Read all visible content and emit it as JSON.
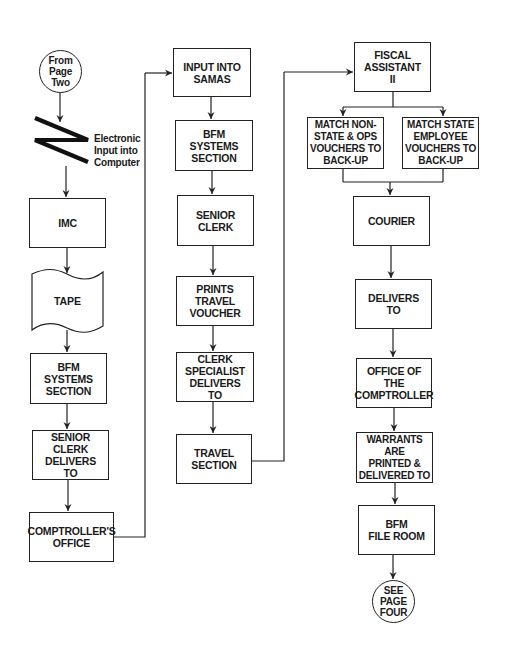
{
  "diagram": {
    "type": "flowchart",
    "colors": {
      "stroke": "#222222",
      "text": "#1a1a1a",
      "background": "#ffffff"
    },
    "columns": [
      {
        "id": "left",
        "nodes": [
          {
            "id": "from-page-two",
            "shape": "circle-connector",
            "label": "From\nPage Two"
          },
          {
            "id": "electronic-input",
            "shape": "lightning-communication-link",
            "label": "Electronic\nInput into\nComputer"
          },
          {
            "id": "imc",
            "shape": "process",
            "label": "IMC"
          },
          {
            "id": "tape",
            "shape": "punched-tape",
            "label": "TAPE"
          },
          {
            "id": "bfm-systems-1",
            "shape": "process",
            "label": "BFM\nSYSTEMS\nSECTION"
          },
          {
            "id": "senior-clerk-delivers",
            "shape": "process",
            "label": "SENIOR\nCLERK\nDELIVERS\nTO"
          },
          {
            "id": "comptrollers-office",
            "shape": "process",
            "label": "COMPTROLLER'S\nOFFICE"
          }
        ]
      },
      {
        "id": "middle",
        "nodes": [
          {
            "id": "input-samas",
            "shape": "process",
            "label": "INPUT INTO\nSAMAS"
          },
          {
            "id": "bfm-systems-2",
            "shape": "process",
            "label": "BFM\nSYSTEMS\nSECTION"
          },
          {
            "id": "senior-clerk",
            "shape": "process",
            "label": "SENIOR\nCLERK"
          },
          {
            "id": "prints-travel-voucher",
            "shape": "process",
            "label": "PRINTS\nTRAVEL\nVOUCHER"
          },
          {
            "id": "clerk-specialist",
            "shape": "process",
            "label": "CLERK\nSPECIALIST\nDELIVERS\nTO"
          },
          {
            "id": "travel-section",
            "shape": "process",
            "label": "TRAVEL\nSECTION"
          }
        ]
      },
      {
        "id": "right",
        "nodes": [
          {
            "id": "fiscal-assistant",
            "shape": "process",
            "label": "FISCAL\nASSISTANT\nII"
          },
          {
            "id": "match-non-state",
            "shape": "process",
            "label": "MATCH NON-\nSTATE & OPS\nVOUCHERS TO\nBACK-UP"
          },
          {
            "id": "match-state",
            "shape": "process",
            "label": "MATCH STATE\nEMPLOYEE\nVOUCHERS TO\nBACK-UP"
          },
          {
            "id": "courier",
            "shape": "process",
            "label": "COURIER"
          },
          {
            "id": "delivers-to",
            "shape": "process",
            "label": "DELIVERS\nTO"
          },
          {
            "id": "office-comptroller",
            "shape": "process",
            "label": "OFFICE OF\nTHE\nCOMPTROLLER"
          },
          {
            "id": "warrants",
            "shape": "process",
            "label": "WARRANTS ARE\nPRINTED &\nDELIVERED TO"
          },
          {
            "id": "bfm-file-room",
            "shape": "process",
            "label": "BFM\nFILE ROOM"
          },
          {
            "id": "see-page-four",
            "shape": "circle-connector",
            "label": "SEE\nPAGE\nFOUR"
          }
        ]
      }
    ],
    "edges": [
      [
        "from-page-two",
        "electronic-input"
      ],
      [
        "electronic-input",
        "imc"
      ],
      [
        "imc",
        "tape"
      ],
      [
        "tape",
        "bfm-systems-1"
      ],
      [
        "bfm-systems-1",
        "senior-clerk-delivers"
      ],
      [
        "senior-clerk-delivers",
        "comptrollers-office"
      ],
      [
        "comptrollers-office",
        "input-samas"
      ],
      [
        "input-samas",
        "bfm-systems-2"
      ],
      [
        "bfm-systems-2",
        "senior-clerk"
      ],
      [
        "senior-clerk",
        "prints-travel-voucher"
      ],
      [
        "prints-travel-voucher",
        "clerk-specialist"
      ],
      [
        "clerk-specialist",
        "travel-section"
      ],
      [
        "travel-section",
        "fiscal-assistant"
      ],
      [
        "fiscal-assistant",
        "match-non-state"
      ],
      [
        "fiscal-assistant",
        "match-state"
      ],
      [
        "match-non-state",
        "courier"
      ],
      [
        "match-state",
        "courier"
      ],
      [
        "courier",
        "delivers-to"
      ],
      [
        "delivers-to",
        "office-comptroller"
      ],
      [
        "office-comptroller",
        "warrants"
      ],
      [
        "warrants",
        "bfm-file-room"
      ],
      [
        "bfm-file-room",
        "see-page-four"
      ]
    ]
  }
}
